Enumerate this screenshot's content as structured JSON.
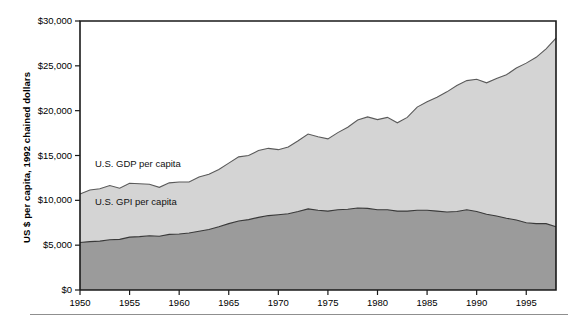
{
  "chart_data": {
    "type": "area",
    "title": "",
    "subtitle": "",
    "xlabel": "",
    "ylabel": "US $ per capita, 1992 chained dollars",
    "xlim": [
      1950,
      1998
    ],
    "ylim": [
      0,
      30000
    ],
    "grid": false,
    "stacked": true,
    "legend_position": "inline-annotations",
    "y_ticks": [
      0,
      5000,
      10000,
      15000,
      20000,
      25000,
      30000
    ],
    "y_tick_labels": [
      "$0",
      "$5,000",
      "$10,000",
      "$15,000",
      "$20,000",
      "$25,000",
      "$30,000"
    ],
    "x_ticks": [
      1950,
      1955,
      1960,
      1965,
      1970,
      1975,
      1980,
      1985,
      1990,
      1995
    ],
    "x_tick_labels": [
      "1950",
      "1955",
      "1960",
      "1965",
      "1970",
      "1975",
      "1980",
      "1985",
      "1990",
      "1995"
    ],
    "x": [
      1950,
      1951,
      1952,
      1953,
      1954,
      1955,
      1956,
      1957,
      1958,
      1959,
      1960,
      1961,
      1962,
      1963,
      1964,
      1965,
      1966,
      1967,
      1968,
      1969,
      1970,
      1971,
      1972,
      1973,
      1974,
      1975,
      1976,
      1977,
      1978,
      1979,
      1980,
      1981,
      1982,
      1983,
      1984,
      1985,
      1986,
      1987,
      1988,
      1989,
      1990,
      1991,
      1992,
      1993,
      1994,
      1995,
      1996,
      1997,
      1998
    ],
    "series": [
      {
        "name": "U.S. GDP per capita",
        "color": "#d4d4d4",
        "line_color": "#5a5a5a",
        "values": [
          10700,
          11150,
          11300,
          11650,
          11350,
          11900,
          11850,
          11800,
          11450,
          11950,
          12050,
          12050,
          12600,
          12900,
          13450,
          14150,
          14850,
          15000,
          15550,
          15800,
          15650,
          15950,
          16650,
          17400,
          17100,
          16850,
          17550,
          18150,
          18950,
          19300,
          19000,
          19250,
          18650,
          19250,
          20400,
          21000,
          21500,
          22100,
          22800,
          23350,
          23500,
          23100,
          23600,
          24000,
          24750,
          25300,
          25950,
          26900,
          28100
        ]
      },
      {
        "name": "U.S. GPI per capita",
        "color": "#9b9b9b",
        "line_color": "#3a3a3a",
        "values": [
          5300,
          5400,
          5450,
          5600,
          5650,
          5900,
          5950,
          6050,
          6000,
          6200,
          6250,
          6350,
          6550,
          6750,
          7050,
          7400,
          7700,
          7850,
          8100,
          8300,
          8400,
          8500,
          8750,
          9050,
          8900,
          8800,
          8950,
          9000,
          9150,
          9100,
          8950,
          8950,
          8800,
          8800,
          8900,
          8900,
          8800,
          8700,
          8750,
          8950,
          8750,
          8450,
          8250,
          8000,
          7800,
          7500,
          7400,
          7400,
          7050
        ]
      }
    ],
    "annotations": [
      {
        "text": "U.S. GDP per capita",
        "x": 1951.5,
        "y": 14000
      },
      {
        "text": "U.S. GPI per capita",
        "x": 1951.5,
        "y": 9800
      }
    ]
  },
  "axis": {
    "y_title": "US $ per capita, 1992 chained dollars"
  }
}
